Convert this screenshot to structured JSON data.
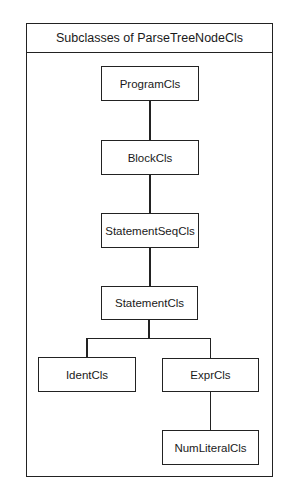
{
  "diagram": {
    "title": "Subclasses of ParseTreeNodeCls",
    "nodes": [
      {
        "id": "program",
        "label": "ProgramCls"
      },
      {
        "id": "block",
        "label": "BlockCls"
      },
      {
        "id": "statementseq",
        "label": "StatementSeqCls"
      },
      {
        "id": "statement",
        "label": "StatementCls"
      },
      {
        "id": "ident",
        "label": "IdentCls"
      },
      {
        "id": "expr",
        "label": "ExprCls"
      },
      {
        "id": "numliteral",
        "label": "NumLiteralCls"
      }
    ],
    "edges": [
      {
        "from": "ProgramCls",
        "to": "BlockCls"
      },
      {
        "from": "BlockCls",
        "to": "StatementSeqCls"
      },
      {
        "from": "StatementSeqCls",
        "to": "StatementCls"
      },
      {
        "from": "StatementCls",
        "to": "IdentCls"
      },
      {
        "from": "StatementCls",
        "to": "ExprCls"
      },
      {
        "from": "ExprCls",
        "to": "NumLiteralCls"
      }
    ]
  }
}
